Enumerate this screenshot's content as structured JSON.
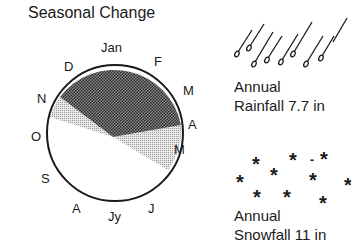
{
  "title": "Seasonal Change",
  "months": [
    {
      "key": "jan",
      "label": "Jan"
    },
    {
      "key": "feb",
      "label": "F"
    },
    {
      "key": "mar",
      "label": "M"
    },
    {
      "key": "apr",
      "label": "A"
    },
    {
      "key": "may",
      "label": "M"
    },
    {
      "key": "jun",
      "label": "J"
    },
    {
      "key": "jul",
      "label": "Jy"
    },
    {
      "key": "aug",
      "label": "A"
    },
    {
      "key": "sep",
      "label": "S"
    },
    {
      "key": "oct",
      "label": "O"
    },
    {
      "key": "nov",
      "label": "N"
    },
    {
      "key": "dec",
      "label": "D"
    }
  ],
  "rainfall": {
    "line1": "Annual",
    "line2": "Rainfall 7.7 in",
    "icon": "raindrops-icon"
  },
  "snowfall": {
    "line1": "Annual",
    "line2": "Snowfall 11 in",
    "icon": "snowflakes-icon"
  },
  "colors": {
    "dark": "#555555",
    "light": "#cfcfcf",
    "ink": "#1a1a1a"
  }
}
